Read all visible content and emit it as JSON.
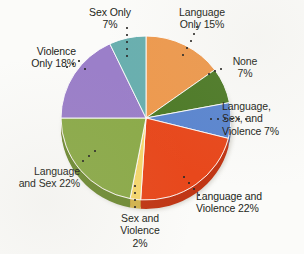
{
  "chart_data": {
    "type": "pie",
    "title": "",
    "subtitle": "",
    "xlabel": "",
    "ylabel": "",
    "legend_position": "none",
    "grid": false,
    "units": "percent",
    "total": 100,
    "start_angle_deg": 0,
    "direction": "clockwise",
    "categories": [
      "Language Only",
      "None",
      "Language, Sex, and Violence",
      "Language and Violence",
      "Sex and Violence",
      "Language and Sex",
      "Violence Only",
      "Sex Only"
    ],
    "values": [
      15,
      7,
      7,
      22,
      2,
      22,
      18,
      7
    ],
    "slices": [
      {
        "id": "language-only",
        "label": "Language\nOnly 15%",
        "name": "Language Only",
        "value": 15,
        "color": "#ee9a4f",
        "rim_color": "#c97c36"
      },
      {
        "id": "none",
        "label": "None\n7%",
        "name": "None",
        "value": 7,
        "color": "#4e7b28",
        "rim_color": "#3d611e"
      },
      {
        "id": "language-sex-violence",
        "label": "Language,\nSex, and\nViolence 7%",
        "name": "Language, Sex, and Violence",
        "value": 7,
        "color": "#5b86d0",
        "rim_color": "#4569ab"
      },
      {
        "id": "language-and-violence",
        "label": "Language and\nViolence 22%",
        "name": "Language and Violence",
        "value": 22,
        "color": "#e8481c",
        "rim_color": "#c03615"
      },
      {
        "id": "sex-and-violence",
        "label": "Sex and\nViolence\n2%",
        "name": "Sex and Violence",
        "value": 2,
        "color": "#f5d76e",
        "rim_color": "#d3b44f"
      },
      {
        "id": "language-and-sex",
        "label": "Language\nand Sex 22%",
        "name": "Language and Sex",
        "value": 22,
        "color": "#8cab4a",
        "rim_color": "#708c36"
      },
      {
        "id": "violence-only",
        "label": "Violence\nOnly 18%",
        "name": "Violence Only",
        "value": 18,
        "color": "#9b7fc9",
        "rim_color": "#7c63a6"
      },
      {
        "id": "sex-only",
        "label": "Sex Only\n7%",
        "name": "Sex Only",
        "value": 7,
        "color": "#69afaf",
        "rim_color": "#4f8f8f"
      }
    ]
  }
}
